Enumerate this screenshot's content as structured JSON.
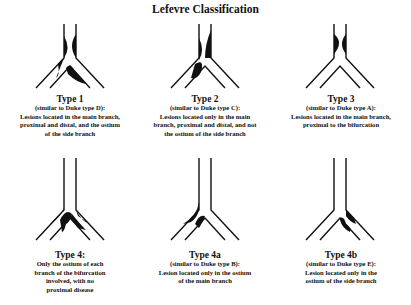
{
  "title": "Lefevre Classification",
  "panels": [
    {
      "type": "Type 1",
      "lines": [
        "(similar to Duke type D):",
        "Lesions located in the main branch,",
        "proximal and distal, and the ostium",
        "of the side branch"
      ],
      "lesions": [
        "main-proximal",
        "main-distal",
        "side-ostium"
      ]
    },
    {
      "type": "Type 2",
      "lines": [
        "(similar to Duke type C):",
        "Lesions located only in the main",
        "branch, proximal and distal, and not",
        "the ostium of the side branch"
      ],
      "lesions": [
        "main-proximal",
        "main-distal"
      ]
    },
    {
      "type": "Type 3",
      "lines": [
        "(similar to Duke type A):",
        "Lesions located in the main branch,",
        "proximal to the bifurcation"
      ],
      "lesions": [
        "main-proximal"
      ]
    },
    {
      "type": "Type 4:",
      "lines": [
        "Only the ostium of each",
        "branch of the bifurcation",
        "involved, with no",
        "proximal disease"
      ],
      "lesions": [
        "main-ostium",
        "side-ostium"
      ]
    },
    {
      "type": "Type 4a",
      "lines": [
        "(similar to Duke type B):",
        "Lesion located only in the ostium",
        "of the main branch"
      ],
      "lesions": [
        "main-ostium"
      ]
    },
    {
      "type": "Type 4b",
      "lines": [
        "(similar to Duke type E):",
        "Lesion located only in the",
        "ostium of the side branch"
      ],
      "lesions": [
        "side-ostium"
      ]
    }
  ]
}
